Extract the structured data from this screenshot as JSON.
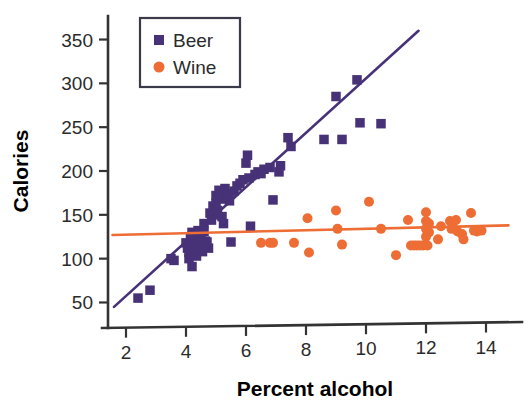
{
  "chart_data": {
    "type": "scatter",
    "title": "",
    "xlabel": "Percent alcohol",
    "ylabel": "Calories",
    "xlim": [
      1.4,
      14.8
    ],
    "ylim": [
      30,
      370
    ],
    "xticks": [
      2,
      4,
      6,
      8,
      10,
      12,
      14
    ],
    "yticks": [
      50,
      100,
      150,
      200,
      250,
      300,
      350
    ],
    "grid": false,
    "legend_position": "upper-left",
    "colors": {
      "beer": "#473278",
      "wine": "#ED6D35",
      "axis": "#333333"
    },
    "series": [
      {
        "name": "Beer",
        "marker": "square",
        "color": "#473278",
        "points": [
          [
            2.4,
            55
          ],
          [
            2.8,
            64
          ],
          [
            3.5,
            100
          ],
          [
            3.6,
            98
          ],
          [
            4.0,
            118
          ],
          [
            4.05,
            112
          ],
          [
            4.1,
            107
          ],
          [
            4.1,
            100
          ],
          [
            4.15,
            124
          ],
          [
            4.2,
            130
          ],
          [
            4.2,
            115
          ],
          [
            4.2,
            105
          ],
          [
            4.2,
            91
          ],
          [
            4.3,
            128
          ],
          [
            4.3,
            120
          ],
          [
            4.3,
            112
          ],
          [
            4.35,
            103
          ],
          [
            4.4,
            132
          ],
          [
            4.4,
            122
          ],
          [
            4.45,
            110
          ],
          [
            4.5,
            127
          ],
          [
            4.5,
            118
          ],
          [
            4.55,
            108
          ],
          [
            4.6,
            140
          ],
          [
            4.6,
            131
          ],
          [
            4.65,
            120
          ],
          [
            4.7,
            119
          ],
          [
            4.75,
            112
          ],
          [
            4.8,
            152
          ],
          [
            4.85,
            144
          ],
          [
            4.9,
            160
          ],
          [
            4.95,
            150
          ],
          [
            5.0,
            172
          ],
          [
            5.0,
            163
          ],
          [
            5.05,
            155
          ],
          [
            5.1,
            178
          ],
          [
            5.15,
            168
          ],
          [
            5.2,
            148
          ],
          [
            5.25,
            140
          ],
          [
            5.3,
            180
          ],
          [
            5.35,
            171
          ],
          [
            5.4,
            174
          ],
          [
            5.45,
            166
          ],
          [
            5.5,
            119
          ],
          [
            5.6,
            177
          ],
          [
            5.7,
            183
          ],
          [
            5.8,
            186
          ],
          [
            5.9,
            190
          ],
          [
            6.0,
            209
          ],
          [
            6.05,
            218
          ],
          [
            6.1,
            192
          ],
          [
            6.15,
            137
          ],
          [
            6.3,
            196
          ],
          [
            6.4,
            199
          ],
          [
            6.5,
            197
          ],
          [
            6.6,
            202
          ],
          [
            6.8,
            204
          ],
          [
            6.9,
            167
          ],
          [
            7.1,
            199
          ],
          [
            7.15,
            206
          ],
          [
            7.4,
            238
          ],
          [
            7.5,
            228
          ],
          [
            8.6,
            236
          ],
          [
            9.0,
            285
          ],
          [
            9.2,
            236
          ],
          [
            9.7,
            304
          ],
          [
            9.8,
            255
          ],
          [
            10.5,
            254
          ]
        ],
        "trend_line": {
          "x": [
            1.6,
            11.75
          ],
          "y": [
            45,
            360
          ]
        }
      },
      {
        "name": "Wine",
        "marker": "circle",
        "color": "#ED6D35",
        "points": [
          [
            6.5,
            118
          ],
          [
            6.8,
            118
          ],
          [
            6.9,
            118
          ],
          [
            7.6,
            118
          ],
          [
            8.05,
            146
          ],
          [
            8.1,
            107
          ],
          [
            9.0,
            155
          ],
          [
            9.05,
            134
          ],
          [
            9.2,
            116
          ],
          [
            10.1,
            165
          ],
          [
            10.5,
            134
          ],
          [
            11.0,
            104
          ],
          [
            11.4,
            144
          ],
          [
            11.5,
            115
          ],
          [
            11.6,
            115
          ],
          [
            11.7,
            115
          ],
          [
            11.8,
            115
          ],
          [
            11.9,
            115
          ],
          [
            12.0,
            153
          ],
          [
            12.0,
            143
          ],
          [
            12.0,
            134
          ],
          [
            12.0,
            125
          ],
          [
            12.05,
            115
          ],
          [
            12.1,
            140
          ],
          [
            12.1,
            130
          ],
          [
            12.4,
            122
          ],
          [
            12.5,
            137
          ],
          [
            12.8,
            143
          ],
          [
            12.85,
            134
          ],
          [
            12.9,
            141
          ],
          [
            13.0,
            144
          ],
          [
            13.05,
            131
          ],
          [
            13.2,
            128
          ],
          [
            13.25,
            122
          ],
          [
            13.5,
            152
          ],
          [
            13.6,
            132
          ],
          [
            13.7,
            131
          ],
          [
            13.85,
            132
          ]
        ],
        "trend_line": {
          "x": [
            1.55,
            14.75
          ],
          "y": [
            127,
            138
          ]
        }
      }
    ],
    "legend": [
      {
        "label": "Beer",
        "marker": "square",
        "color": "#473278"
      },
      {
        "label": "Wine",
        "marker": "circle",
        "color": "#ED6D35"
      }
    ]
  }
}
